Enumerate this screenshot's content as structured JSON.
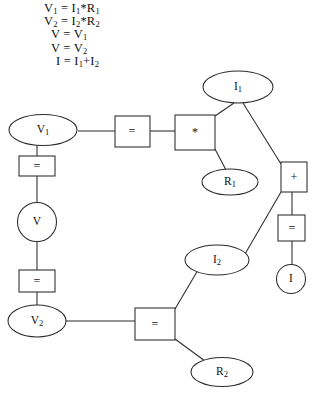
{
  "equations": {
    "lines": [
      "V₁ = I₁*R₁",
      "V₂ = I₂*R₂",
      "V = V₁",
      "V = V₂",
      "I = I₁+I₂"
    ]
  },
  "diagram": {
    "type": "constraint-network",
    "variable_nodes": [
      {
        "id": "V1",
        "label": "V₁",
        "shape": "ellipse",
        "x": 43,
        "y": 130
      },
      {
        "id": "V",
        "label": "V",
        "shape": "circle",
        "x": 37,
        "y": 222
      },
      {
        "id": "V2",
        "label": "V₂",
        "shape": "ellipse",
        "x": 37,
        "y": 321
      },
      {
        "id": "I1",
        "label": "I₁",
        "shape": "ellipse",
        "x": 238,
        "y": 87
      },
      {
        "id": "R1",
        "label": "R₁",
        "shape": "ellipse",
        "x": 230,
        "y": 182
      },
      {
        "id": "I2",
        "label": "I₂",
        "shape": "ellipse",
        "x": 217,
        "y": 260
      },
      {
        "id": "R2",
        "label": "R₂",
        "shape": "ellipse",
        "x": 222,
        "y": 372
      },
      {
        "id": "I",
        "label": "I",
        "shape": "circle",
        "x": 291,
        "y": 279
      }
    ],
    "operator_nodes": [
      {
        "id": "eq-top-left",
        "label": "=",
        "shape": "rect",
        "x": 132,
        "y": 131
      },
      {
        "id": "mult-top",
        "label": "*",
        "shape": "rect",
        "x": 195,
        "y": 132
      },
      {
        "id": "eq-left-upper",
        "label": "=",
        "shape": "rect",
        "x": 37,
        "y": 165
      },
      {
        "id": "eq-left-lower",
        "label": "=",
        "shape": "rect",
        "x": 37,
        "y": 281
      },
      {
        "id": "eq-bottom",
        "label": "=",
        "shape": "rect",
        "x": 155,
        "y": 324
      },
      {
        "id": "plus-right",
        "label": "+",
        "shape": "rect",
        "x": 294,
        "y": 177
      },
      {
        "id": "eq-right",
        "label": "=",
        "shape": "rect",
        "x": 291,
        "y": 228
      }
    ],
    "edges": [
      {
        "from": "V1",
        "to": "eq-top-left"
      },
      {
        "from": "eq-top-left",
        "to": "mult-top"
      },
      {
        "from": "mult-top",
        "to": "I1"
      },
      {
        "from": "mult-top",
        "to": "R1"
      },
      {
        "from": "I1",
        "to": "plus-right"
      },
      {
        "from": "I2",
        "to": "plus-right"
      },
      {
        "from": "plus-right",
        "to": "eq-right"
      },
      {
        "from": "eq-right",
        "to": "I"
      },
      {
        "from": "V1",
        "to": "eq-left-upper"
      },
      {
        "from": "eq-left-upper",
        "to": "V"
      },
      {
        "from": "V",
        "to": "eq-left-lower"
      },
      {
        "from": "eq-left-lower",
        "to": "V2"
      },
      {
        "from": "V2",
        "to": "eq-bottom"
      },
      {
        "from": "eq-bottom",
        "to": "I2"
      },
      {
        "from": "eq-bottom",
        "to": "R2"
      }
    ],
    "colors": {
      "stroke": "#2b2b2b",
      "fill": "#ffffff",
      "background": "#ffffff"
    }
  }
}
